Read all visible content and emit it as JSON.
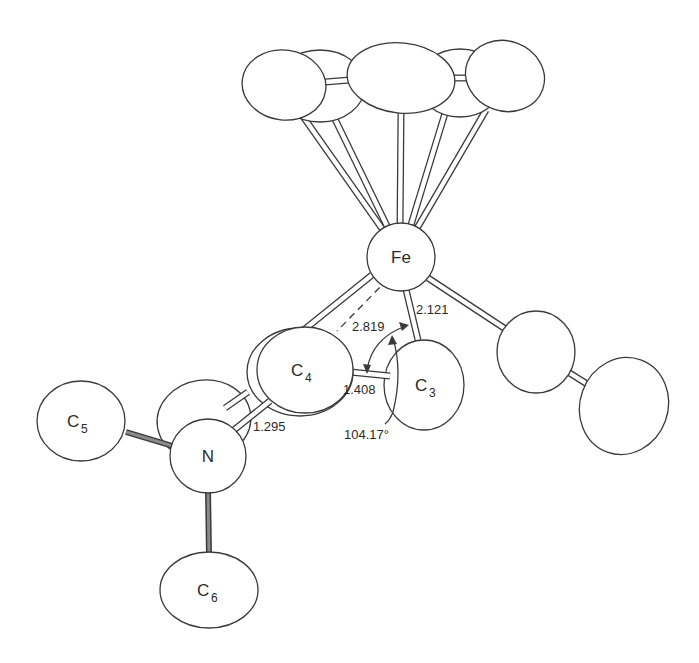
{
  "diagram": {
    "type": "ORTEP molecular structure",
    "atoms": {
      "fe": {
        "symbol": "Fe"
      },
      "c3": {
        "symbol": "C",
        "sub": "3"
      },
      "c4": {
        "symbol": "C",
        "sub": "4"
      },
      "c5": {
        "symbol": "C",
        "sub": "5"
      },
      "c6": {
        "symbol": "C",
        "sub": "6"
      },
      "n": {
        "symbol": "N"
      }
    },
    "measurements": {
      "fe_c4": "2.819",
      "fe_c3": "2.121",
      "c3_c4": "1.408",
      "c4_n": "1.295",
      "angle": "104.17°"
    }
  }
}
